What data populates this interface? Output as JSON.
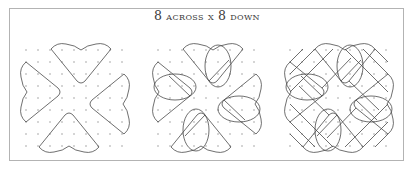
{
  "figure": {
    "title_parts": [
      "8",
      " across x ",
      "8",
      " down"
    ],
    "title_text": "8 across x 8 down",
    "colors": {
      "frame": "#b3b3b3",
      "line": "#4a4a4a",
      "dot": "#8a8a8a",
      "text": "#3a3a3a"
    },
    "grid": {
      "rows": 9,
      "cols": 9,
      "spacing": 12,
      "origin_y": 50
    },
    "panels": [
      {
        "name": "step-1",
        "origin_x": 26,
        "center": [
          75,
          98
        ],
        "ellipses": false,
        "diagonals": false
      },
      {
        "name": "step-2",
        "origin_x": 158,
        "center": [
          207,
          98
        ],
        "ellipses": true,
        "diagonals": false
      },
      {
        "name": "step-3",
        "origin_x": 290,
        "center": [
          339,
          98
        ],
        "ellipses": true,
        "diagonals": true
      }
    ]
  }
}
